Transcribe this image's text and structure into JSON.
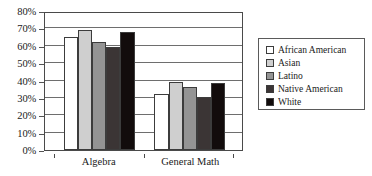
{
  "chart_data": {
    "type": "bar",
    "title": "",
    "subtitle": "",
    "xlabel": "",
    "ylabel": "",
    "categories": [
      "Algebra",
      "General Math"
    ],
    "ylim": [
      0,
      80
    ],
    "ytick_values": [
      0,
      10,
      20,
      30,
      40,
      50,
      60,
      70,
      80
    ],
    "ytick_labels": [
      "0%",
      "10%",
      "20%",
      "30%",
      "40%",
      "50%",
      "60%",
      "70%",
      "80%"
    ],
    "grid": true,
    "legend_position": "right",
    "series": [
      {
        "name": "African American",
        "color": "#ffffff",
        "values": [
          66,
          33
        ]
      },
      {
        "name": "Asian",
        "color": "#cfcfcf",
        "values": [
          70,
          40
        ]
      },
      {
        "name": "Latino",
        "color": "#949494",
        "values": [
          63,
          37
        ]
      },
      {
        "name": "Native American",
        "color": "#3b3535",
        "values": [
          60,
          31
        ]
      },
      {
        "name": "White",
        "color": "#120c0c",
        "values": [
          69,
          39
        ]
      }
    ]
  },
  "legend": {
    "items": [
      {
        "label": "African American",
        "color": "#ffffff"
      },
      {
        "label": "Asian",
        "color": "#cfcfcf"
      },
      {
        "label": "Latino",
        "color": "#949494"
      },
      {
        "label": "Native American",
        "color": "#3b3535"
      },
      {
        "label": "White",
        "color": "#120c0c"
      }
    ]
  },
  "colors": {
    "axis": "#4a4a4a",
    "gridline": "#6e6e6e",
    "text": "#1a1a1a",
    "background": "#ffffff"
  }
}
